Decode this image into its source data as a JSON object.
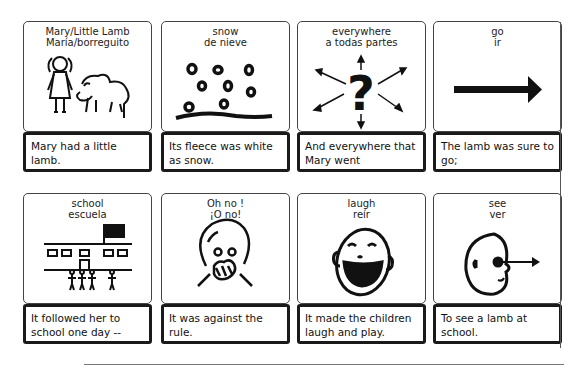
{
  "cards": [
    {
      "label_en": "Mary/Little Lamb",
      "label_es": "María/borreguito",
      "icon": "girl-and-lamb-icon",
      "caption": "Mary had a little lamb."
    },
    {
      "label_en": "snow",
      "label_es": "de nieve",
      "icon": "snowflakes-icon",
      "caption": "Its fleece was white as snow."
    },
    {
      "label_en": "everywhere",
      "label_es": "a todas partes",
      "icon": "question-arrows-icon",
      "caption": "And everywhere that Mary went"
    },
    {
      "label_en": "go",
      "label_es": "ir",
      "icon": "right-arrow-icon",
      "caption": "The lamb was sure to go;"
    },
    {
      "label_en": "school",
      "label_es": "escuela",
      "icon": "school-building-icon",
      "caption": "It followed her to school one day --"
    },
    {
      "label_en": "Oh no !",
      "label_es": "¡O no!",
      "icon": "surprised-face-icon",
      "caption": "It was against the rule."
    },
    {
      "label_en": "laugh",
      "label_es": "reír",
      "icon": "laughing-face-icon",
      "caption": "It made the children laugh and play."
    },
    {
      "label_en": "see",
      "label_es": "ver",
      "icon": "eye-looking-icon",
      "caption": "To see a lamb at school."
    }
  ]
}
